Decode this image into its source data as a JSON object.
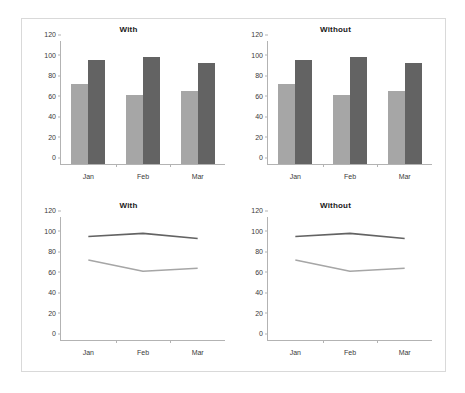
{
  "figure": {
    "background": "#ffffff",
    "border_color": "#d9d9d9"
  },
  "colors": {
    "series_light": "#a6a6a6",
    "series_dark": "#636363",
    "axis": "#b3b3b3",
    "text": "#3a3a3a"
  },
  "chart_data": [
    {
      "type": "bar",
      "title": "With",
      "categories": [
        "Jan",
        "Feb",
        "Mar"
      ],
      "series": [
        {
          "name": "Series 1",
          "values": [
            78,
            67,
            71
          ],
          "color": "#a6a6a6"
        },
        {
          "name": "Series 2",
          "values": [
            101,
            104,
            99
          ],
          "color": "#636363"
        }
      ],
      "xlabel": "",
      "ylabel": "",
      "ylim": [
        0,
        120
      ],
      "yticks": [
        0,
        20,
        40,
        60,
        80,
        100,
        120
      ],
      "grid": false,
      "legend": "none"
    },
    {
      "type": "bar",
      "title": "Without",
      "categories": [
        "Jan",
        "Feb",
        "Mar"
      ],
      "series": [
        {
          "name": "Series 1",
          "values": [
            78,
            67,
            71
          ],
          "color": "#a6a6a6"
        },
        {
          "name": "Series 2",
          "values": [
            101,
            104,
            99
          ],
          "color": "#636363"
        }
      ],
      "xlabel": "",
      "ylabel": "",
      "ylim": [
        0,
        120
      ],
      "yticks": [
        0,
        20,
        40,
        60,
        80,
        100,
        120
      ],
      "grid": false,
      "legend": "none"
    },
    {
      "type": "line",
      "title": "With",
      "categories": [
        "Jan",
        "Feb",
        "Mar"
      ],
      "series": [
        {
          "name": "Series 2",
          "values": [
            101,
            104,
            99
          ],
          "color": "#636363"
        },
        {
          "name": "Series 1",
          "values": [
            78,
            67,
            70
          ],
          "color": "#a6a6a6"
        }
      ],
      "xlabel": "",
      "ylabel": "",
      "ylim": [
        0,
        120
      ],
      "yticks": [
        0,
        20,
        40,
        60,
        80,
        100,
        120
      ],
      "grid": false,
      "legend": "none"
    },
    {
      "type": "line",
      "title": "Without",
      "categories": [
        "Jan",
        "Feb",
        "Mar"
      ],
      "series": [
        {
          "name": "Series 2",
          "values": [
            101,
            104,
            99
          ],
          "color": "#636363"
        },
        {
          "name": "Series 1",
          "values": [
            78,
            67,
            70
          ],
          "color": "#a6a6a6"
        }
      ],
      "xlabel": "",
      "ylabel": "",
      "ylim": [
        0,
        120
      ],
      "yticks": [
        0,
        20,
        40,
        60,
        80,
        100,
        120
      ],
      "grid": false,
      "legend": "none"
    }
  ]
}
